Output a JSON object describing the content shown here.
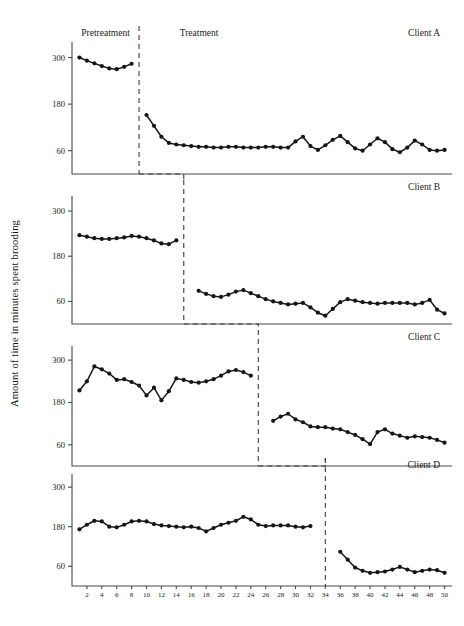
{
  "figure": {
    "ylabel": "Amount of time in minutes spent brooding",
    "phase_labels": {
      "pre": "Pretreatment",
      "post": "Treatment"
    }
  },
  "chart_data": {
    "type": "line",
    "title": "",
    "xlabel": "",
    "ylabel": "Amount of time in minutes spent brooding",
    "xlim": [
      0,
      51
    ],
    "ylim": [
      0,
      340
    ],
    "yticks": [
      60,
      180,
      300
    ],
    "xticks": [
      2,
      4,
      6,
      8,
      10,
      12,
      14,
      16,
      18,
      20,
      22,
      24,
      26,
      28,
      30,
      32,
      34,
      36,
      38,
      40,
      42,
      44,
      46,
      48,
      50
    ],
    "grid": false,
    "legend": "none",
    "design": "multiple-baseline-across-subjects",
    "panels": [
      {
        "name": "Client A",
        "phase_change_x": 9,
        "series": [
          {
            "name": "Pretreatment",
            "x": [
              1,
              2,
              3,
              4,
              5,
              6,
              7,
              8
            ],
            "values": [
              300,
              292,
              285,
              278,
              272,
              270,
              276,
              284
            ]
          },
          {
            "name": "Treatment",
            "x": [
              10,
              11,
              12,
              13,
              14,
              15,
              16,
              17,
              18,
              19,
              20,
              21,
              22,
              23,
              24,
              25,
              26,
              27,
              28,
              29,
              30,
              31,
              32,
              33,
              34,
              35,
              36,
              37,
              38,
              39,
              40,
              41,
              42,
              43,
              44,
              45,
              46,
              47,
              48,
              49,
              50
            ],
            "values": [
              152,
              124,
              96,
              80,
              76,
              74,
              72,
              70,
              70,
              68,
              68,
              70,
              70,
              68,
              68,
              68,
              70,
              70,
              68,
              68,
              84,
              96,
              72,
              62,
              74,
              88,
              98,
              82,
              66,
              60,
              76,
              92,
              82,
              64,
              56,
              68,
              86,
              76,
              62,
              60,
              62,
              56,
              48,
              40,
              34,
              30,
              28,
              26,
              24,
              24
            ]
          }
        ]
      },
      {
        "name": "Client B",
        "phase_change_x": 15,
        "series": [
          {
            "name": "Pretreatment",
            "x": [
              1,
              2,
              3,
              4,
              5,
              6,
              7,
              8,
              9,
              10,
              11,
              12,
              13,
              14
            ],
            "values": [
              236,
              232,
              228,
              226,
              226,
              228,
              230,
              234,
              232,
              228,
              222,
              214,
              212,
              222
            ]
          },
          {
            "name": "Treatment",
            "x": [
              17,
              18,
              19,
              20,
              21,
              22,
              23,
              24,
              25,
              26,
              27,
              28,
              29,
              30,
              31,
              32,
              33,
              34,
              35,
              36,
              37,
              38,
              39,
              40,
              41,
              42,
              43,
              44,
              45,
              46,
              47,
              48,
              49,
              50
            ],
            "values": [
              88,
              80,
              74,
              72,
              78,
              86,
              90,
              82,
              74,
              66,
              60,
              56,
              52,
              54,
              56,
              44,
              30,
              22,
              40,
              58,
              66,
              62,
              58,
              56,
              54,
              56,
              56,
              56,
              56,
              52,
              56,
              64,
              38,
              28,
              42,
              54,
              58,
              60
            ]
          }
        ]
      },
      {
        "name": "Client C",
        "phase_change_x": 25,
        "series": [
          {
            "name": "Pretreatment",
            "x": [
              1,
              2,
              3,
              4,
              5,
              6,
              7,
              8,
              9,
              10,
              11,
              12,
              13,
              14,
              15,
              16,
              17,
              18,
              19,
              20,
              21,
              22,
              23,
              24
            ],
            "values": [
              214,
              240,
              282,
              274,
              262,
              244,
              246,
              238,
              228,
              200,
              222,
              186,
              212,
              248,
              244,
              238,
              236,
              240,
              246,
              256,
              268,
              272,
              266,
              256
            ]
          },
          {
            "name": "Treatment",
            "x": [
              27,
              28,
              29,
              30,
              31,
              32,
              33,
              34,
              35,
              36,
              37,
              38,
              39,
              40,
              41,
              42,
              43,
              44,
              45,
              46,
              47,
              48,
              49,
              50
            ],
            "values": [
              128,
              140,
              148,
              132,
              124,
              112,
              110,
              110,
              106,
              104,
              96,
              88,
              76,
              62,
              96,
              104,
              92,
              86,
              80,
              84,
              82,
              80,
              74,
              66,
              58
            ]
          }
        ]
      },
      {
        "name": "Client D",
        "phase_change_x": 34,
        "series": [
          {
            "name": "Pretreatment",
            "x": [
              1,
              2,
              3,
              4,
              5,
              6,
              7,
              8,
              9,
              10,
              11,
              12,
              13,
              14,
              15,
              16,
              17,
              18,
              19,
              20,
              21,
              22,
              23,
              24,
              25,
              26,
              27,
              28,
              29,
              30,
              31,
              32
            ],
            "values": [
              172,
              186,
              198,
              196,
              180,
              178,
              186,
              196,
              198,
              196,
              188,
              184,
              182,
              180,
              178,
              180,
              176,
              166,
              176,
              186,
              192,
              198,
              210,
              202,
              186,
              182,
              184,
              184,
              184,
              180,
              178,
              182
            ]
          },
          {
            "name": "Treatment",
            "x": [
              36,
              37,
              38,
              39,
              40,
              41,
              42,
              43,
              44,
              45,
              46,
              47,
              48,
              49,
              50
            ],
            "values": [
              104,
              80,
              56,
              46,
              40,
              42,
              44,
              50,
              58,
              50,
              42,
              46,
              50,
              48,
              40
            ]
          }
        ]
      }
    ]
  }
}
